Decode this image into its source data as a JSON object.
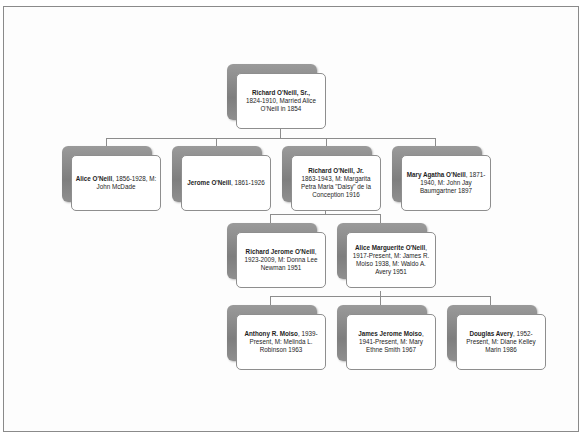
{
  "diagram": {
    "type": "family-tree",
    "colors": {
      "shadow": "#8a8a8a",
      "card_border": "#8e8e8e",
      "connector": "#8c8c8c",
      "frame": "#8a8a8a"
    },
    "root": {
      "name": "Richard O'Neill, Sr.,",
      "details": "1824-1910, Married Alice O'Neill in 1854"
    },
    "children": [
      {
        "name": "Alice O'Neill",
        "details": ", 1856-1928, M: John McDade"
      },
      {
        "name": "Jerome O'Neill",
        "details": ", 1861-1926"
      },
      {
        "name": "Richard O'Neill, Jr.",
        "details": "1863-1943, M: Margarita Petra Maria \"Daisy\" de la Conception 1916"
      },
      {
        "name": "Mary Agatha O'Neill",
        "details": ", 1871-1940, M: John Jay Baumgartner 1897"
      }
    ],
    "grandchildren": [
      {
        "name": "Richard Jerome O'Neill",
        "details": ", 1923-2009, M: Donna Lee Newman 1951"
      },
      {
        "name": "Alice Marguerite O'Neill",
        "details": ", 1917-Present, M: James R. Moiso 1938, M: Waldo A. Avery 1951"
      }
    ],
    "great_grandchildren": [
      {
        "name": "Anthony R. Moiso",
        "details": ", 1939-Present, M: Melinda L. Robinson 1963"
      },
      {
        "name": "James Jerome Moiso",
        "details": ", 1941-Present, M: Mary Ethne Smith 1967"
      },
      {
        "name": "Douglas Avery",
        "details": ", 1952-Present, M: Diane Kelley Marin 1986"
      }
    ]
  }
}
